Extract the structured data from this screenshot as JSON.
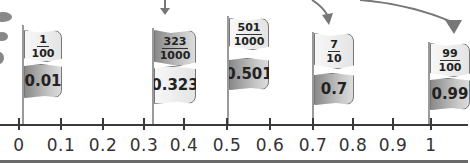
{
  "number_line": {
    "ticks": [
      {
        "label": "0",
        "x": 18
      },
      {
        "label": "0.1",
        "x": 60
      },
      {
        "label": "0.2",
        "x": 102
      },
      {
        "label": "0.3",
        "x": 143
      },
      {
        "label": "0.4",
        "x": 183
      },
      {
        "label": "0.5",
        "x": 226
      },
      {
        "label": "0.6",
        "x": 269
      },
      {
        "label": "0.7",
        "x": 312
      },
      {
        "label": "0.8",
        "x": 352
      },
      {
        "label": "0.9",
        "x": 392
      },
      {
        "label": "1",
        "x": 430
      }
    ]
  },
  "flags": [
    {
      "numerator": "1",
      "denominator": "100",
      "decimal": "0.01",
      "top_style": "light",
      "bottom_style": "dark"
    },
    {
      "numerator": "323",
      "denominator": "1000",
      "decimal": "0.323",
      "top_style": "dark",
      "bottom_style": "light"
    },
    {
      "numerator": "501",
      "denominator": "1000",
      "decimal": "0.501",
      "top_style": "light",
      "bottom_style": "dark"
    },
    {
      "numerator": "7",
      "denominator": "10",
      "decimal": "0.7",
      "top_style": "light",
      "bottom_style": "dark"
    },
    {
      "numerator": "99",
      "denominator": "100",
      "decimal": "0.99",
      "top_style": "light",
      "bottom_style": "dark"
    }
  ],
  "colors": {
    "axis": "#3a3a3a",
    "flag_light": "#eeeeee",
    "flag_dark": "#9a9a9a",
    "arrow": "#777777"
  }
}
